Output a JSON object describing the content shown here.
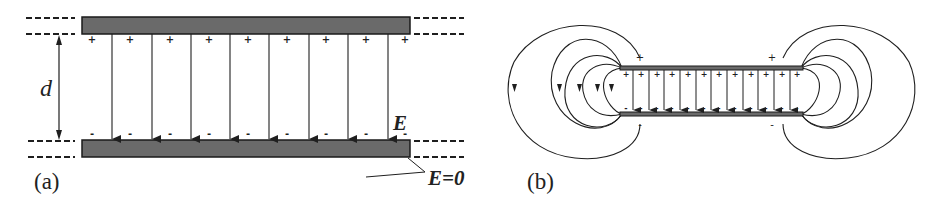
{
  "colors": {
    "ink": "#1f1f1f",
    "plate_fill": "#6a6a6a",
    "plate_stroke": "#1a1a1a",
    "background": "#ffffff"
  },
  "panel_a": {
    "label": "(a)",
    "distance_label": "d",
    "field_label": "E",
    "zero_field_label": "E=0",
    "top_plate": {
      "x": 82,
      "y": 17,
      "w": 328,
      "h": 17
    },
    "bottom_plate": {
      "x": 82,
      "y": 140,
      "w": 328,
      "h": 17
    },
    "field_arrow_x": [
      112,
      152,
      191,
      230,
      269,
      309,
      348,
      388
    ],
    "charge_marker_x": [
      92,
      130,
      170,
      209,
      248,
      287,
      326,
      366,
      405
    ],
    "top_charge": "+",
    "bottom_charge": "-"
  },
  "panel_b": {
    "label": "(b)",
    "top_plate": {
      "x": 620,
      "y": 66,
      "w": 183,
      "h": 4
    },
    "bottom_plate": {
      "x": 620,
      "y": 112,
      "w": 183,
      "h": 4
    },
    "field_arrow_x": [
      633,
      649,
      664,
      680,
      696,
      711,
      727,
      743,
      758,
      774,
      790
    ],
    "charge_marker_x": [
      626,
      641,
      657,
      672,
      688,
      704,
      719,
      735,
      751,
      766,
      782,
      797
    ],
    "top_charge": "+",
    "bottom_charge": "-"
  }
}
